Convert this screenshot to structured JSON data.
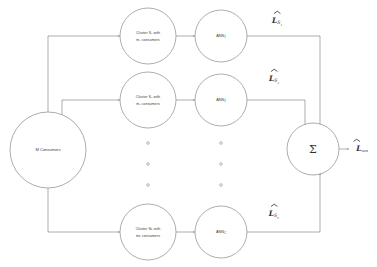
{
  "diagram": {
    "colors": {
      "stroke": "#8a8a8a",
      "text": "#3a3a3a",
      "label_text": "#2e2e2e",
      "background": "#ffffff"
    },
    "source_node": {
      "label": "M Consumers"
    },
    "aggregator_node": {
      "label": "Σ",
      "name": "summation"
    },
    "branches": [
      {
        "id": "branch-1",
        "cluster_line1": "Cluster S₁ with",
        "cluster_line2": "m₁ consumers",
        "ann_label": "ANN",
        "ann_subscript": "1",
        "output_label_base": "L",
        "output_label_sub": "S",
        "output_label_subsub": "1"
      },
      {
        "id": "branch-2",
        "cluster_line1": "Cluster S₂ with",
        "cluster_line2": "m₂ consumers",
        "ann_label": "ANN",
        "ann_subscript": "2",
        "output_label_base": "L",
        "output_label_sub": "S",
        "output_label_subsub": "2"
      },
      {
        "id": "branch-c",
        "cluster_line1": "Cluster Sᴄ with",
        "cluster_line2": "mᴄ consumers",
        "ann_label": "ANN",
        "ann_subscript": "C",
        "output_label_base": "L",
        "output_label_sub": "S",
        "output_label_subsub": "C"
      }
    ],
    "ellipsis": {
      "symbol": "○",
      "count_per_column": 3,
      "columns": 2
    },
    "final_output": {
      "base": "L",
      "subscript": "SEM"
    }
  }
}
